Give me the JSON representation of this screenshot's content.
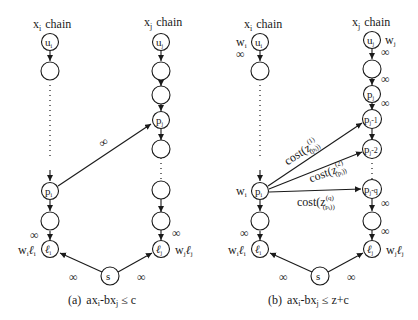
{
  "diagram_a": {
    "left_chain_title": "x",
    "left_chain_title_sub": "i",
    "left_chain_title_word": "chain",
    "right_chain_title": "x",
    "right_chain_title_sub": "j",
    "right_chain_title_word": "chain",
    "nodes": {
      "ui": "u",
      "ui_sub": "i",
      "pi": "p",
      "pi_sub": "i",
      "li": "ℓ",
      "li_sub": "i",
      "uj": "u",
      "uj_sub": "j",
      "pj": "p",
      "pj_sub": "j",
      "lj": "ℓ",
      "lj_sub": "j",
      "s": "s"
    },
    "edge_labels": {
      "cross": "∞",
      "li_in": "∞",
      "lj_in": "∞",
      "s_to_li": "∞",
      "s_to_lj": "∞"
    },
    "weights": {
      "li_w": "w",
      "li_w_sub": "i",
      "li_l": "ℓ",
      "li_l_sub": "i",
      "lj_w": "w",
      "lj_w_sub": "j",
      "lj_l": "ℓ",
      "lj_l_sub": "j"
    },
    "caption_prefix": "(a)",
    "caption": "ax",
    "caption_parts": [
      "ax",
      "i",
      "-bx",
      "j",
      " ≤ c"
    ]
  },
  "diagram_b": {
    "left_chain_title": "x",
    "left_chain_title_sub": "i",
    "left_chain_title_word": "chain",
    "right_chain_title": "x",
    "right_chain_title_sub": "j",
    "right_chain_title_word": "chain",
    "nodes": {
      "ui": "u",
      "ui_sub": "i",
      "pi": "p",
      "pi_sub": "i",
      "li": "ℓ",
      "li_sub": "i",
      "uj": "u",
      "uj_sub": "j",
      "pj": "p",
      "pj_sub": "j",
      "pj1": "p",
      "pj1_sub": "j",
      "pj1_suffix": "-1",
      "pj2": "p",
      "pj2_sub": "j",
      "pj2_suffix": "-2",
      "pjq": "p",
      "pjq_sub": "j",
      "pjq_suffix": "-q",
      "lj": "ℓ",
      "lj_sub": "j",
      "s": "s"
    },
    "edge_labels": {
      "ui_out": "∞",
      "uj_out": "∞",
      "uj_empty_out": "∞",
      "pj_out": "∞",
      "pjq_out": "∞",
      "lj_in": "∞",
      "li_in": "∞",
      "s_to_li": "∞",
      "s_to_lj": "∞",
      "cost1": "cost(z",
      "cost1_sup": "(1)",
      "cost1_sub": "(p",
      "cost1_subsub": "i",
      "cost1_close": "))",
      "cost2": "cost(z",
      "cost2_sup": "(2)",
      "cost2_sub": "(p",
      "cost2_subsub": "i",
      "cost2_close": "))",
      "costq": "cost(z",
      "costq_sup": "(q)",
      "costq_sub": "(p",
      "costq_subsub": "i",
      "costq_close": "))"
    },
    "weights": {
      "ui_w": "w",
      "ui_w_sub": "i",
      "uj_w": "w",
      "uj_w_sub": "j",
      "pi_w": "w",
      "pi_w_sub": "i",
      "li_w": "w",
      "li_w_sub": "i",
      "li_l": "ℓ",
      "li_l_sub": "i",
      "lj_w": "w",
      "lj_w_sub": "j",
      "lj_l": "ℓ",
      "lj_l_sub": "j"
    },
    "caption_prefix": "(b)",
    "caption_parts": [
      "ax",
      "i",
      "-bx",
      "j",
      " ≤ z+c"
    ]
  }
}
